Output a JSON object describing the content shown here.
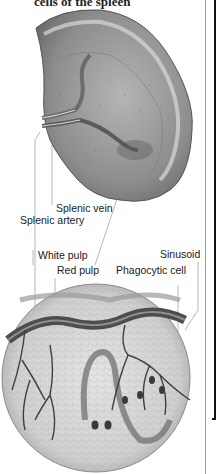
{
  "figure": {
    "title": "cells of the spleen",
    "labels": {
      "splenic_vein": "Splenic vein",
      "splenic_artery": "Splenic artery",
      "white_pulp": "White pulp",
      "red_pulp": "Red pulp",
      "sinusoid": "Sinusoid",
      "phagocytic_cell": "Phagocytic cell"
    },
    "colors": {
      "organ_fill": "#9a9a9a",
      "organ_dark": "#5a5a5a",
      "vessel": "#4a4a4a",
      "leader_line": "#888888",
      "text": "#1a1a1a"
    }
  }
}
